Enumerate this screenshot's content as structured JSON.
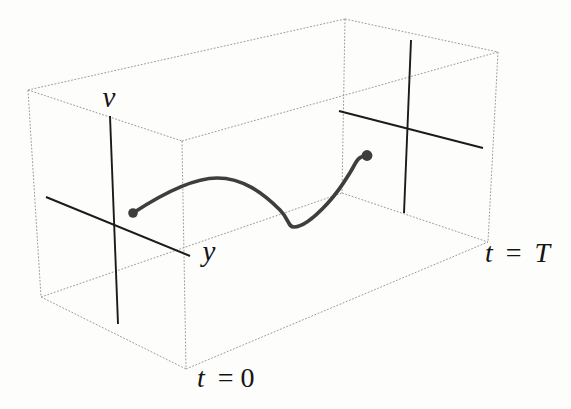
{
  "figure": {
    "labels": {
      "v_axis": "v",
      "y_axis": "y",
      "t_start_var": "t",
      "t_start_rest": "= 0",
      "t_end_var": "t",
      "t_end_eq": "=",
      "t_end_value": "T"
    },
    "colors": {
      "background": "#fdfdfc",
      "box_edge": "#9b9b9b",
      "axis": "#1b1b1b",
      "curve": "#3e3e3e",
      "label": "#141414"
    }
  }
}
